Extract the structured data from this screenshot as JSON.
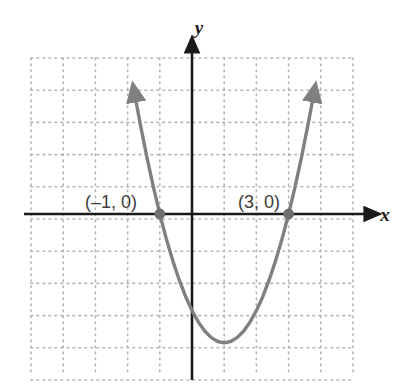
{
  "figure": {
    "background_color": "#ffffff",
    "width": 407,
    "height": 389
  },
  "axes": {
    "x_label": "x",
    "y_label": "y",
    "axis_color": "#1a1a1a",
    "origin_px": [
      192,
      214
    ],
    "unit_px": 32.2,
    "x_axis_start_px": 24,
    "x_axis_end_px": 372,
    "y_axis_top_px": 45,
    "y_axis_bottom_px": 380
  },
  "grid": {
    "style": "dotted",
    "color": "#b4b4b4",
    "cell_px": 32.2,
    "left_px": 31,
    "top_px": 58,
    "right_px": 355,
    "bottom_px": 372,
    "columns": 10,
    "rows": 10
  },
  "annotations": [
    {
      "name": "left-intercept-label",
      "text": "(–1, 0)",
      "x_px": 85,
      "y_px": 208
    },
    {
      "name": "right-intercept-label",
      "text": "(3, 0)",
      "x_px": 238,
      "y_px": 208
    }
  ],
  "chart_data": {
    "type": "line",
    "title": "",
    "xlabel": "x",
    "ylabel": "y",
    "grid": true,
    "legend": false,
    "curve_color": "#808080",
    "point_color": "#6e6e6e",
    "function": "y = (x - 1)^2 - 4",
    "equivalent_form": "y = x^2 - 2x - 3",
    "vertex": [
      1,
      -4
    ],
    "roots": [
      -1,
      3
    ],
    "y_intercept": -3,
    "xlim": [
      -5,
      5
    ],
    "ylim": [
      -5,
      5
    ],
    "x_ticks": [
      -5,
      -4,
      -3,
      -2,
      -1,
      0,
      1,
      2,
      3,
      4,
      5
    ],
    "y_ticks": [
      -5,
      -4,
      -3,
      -2,
      -1,
      0,
      1,
      2,
      3,
      4,
      5
    ],
    "x": [
      -1.74,
      -1.6,
      -1.4,
      -1.2,
      -1.0,
      -0.8,
      -0.6,
      -0.4,
      -0.2,
      0.0,
      0.2,
      0.4,
      0.6,
      0.8,
      1.0,
      1.2,
      1.4,
      1.6,
      1.8,
      2.0,
      2.2,
      2.4,
      2.6,
      2.8,
      3.0,
      3.2,
      3.4,
      3.6,
      3.74
    ],
    "values": [
      3.51,
      2.76,
      1.76,
      0.84,
      0.0,
      -0.76,
      -1.44,
      -2.04,
      -2.56,
      -3.0,
      -3.36,
      -3.64,
      -3.84,
      -3.96,
      -4.0,
      -3.96,
      -3.84,
      -3.64,
      -3.36,
      -3.0,
      -2.56,
      -2.04,
      -1.44,
      -0.76,
      0.0,
      0.84,
      1.76,
      2.76,
      3.51
    ],
    "markers": [
      {
        "label": "(–1, 0)",
        "x": -1,
        "y": 0
      },
      {
        "label": "(3, 0)",
        "x": 3,
        "y": 0
      }
    ],
    "arrows": [
      "left-branch-up",
      "right-branch-up"
    ]
  }
}
